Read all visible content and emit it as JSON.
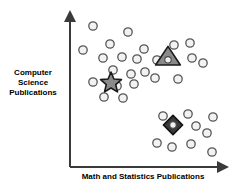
{
  "figure": {
    "background_color": "#ffffff",
    "axis_color": "#3a3a3a"
  },
  "axes": {
    "y_label": "Computer\nScience\nPublications",
    "x_label": "Math and Statistics Publications",
    "y_axis_name": "Computer Science Publications",
    "x_axis_name": "Math and Statistics Publications",
    "origin_x": 70,
    "origin_y": 167,
    "y_top": 14,
    "x_right": 226
  },
  "chart_data": {
    "type": "scatter",
    "title": "",
    "xlabel": "Math and Statistics Publications",
    "ylabel": "Computer Science Publications",
    "xlim": [
      0,
      100
    ],
    "ylim": [
      0,
      100
    ],
    "grid": false,
    "legend": "none",
    "axis_style": "arrow-axes",
    "tick_labels": {
      "x": [],
      "y": []
    },
    "series": [
      {
        "name": "Cluster 1 points",
        "marker": "circle",
        "marker_fill": "#f2f2f2",
        "marker_stroke": "#555555",
        "radius": 4.2,
        "points": [
          [
            93,
            26
          ],
          [
            128,
            32
          ],
          [
            110,
            44
          ],
          [
            83,
            50
          ],
          [
            144,
            49
          ],
          [
            103,
            58
          ],
          [
            122,
            57
          ],
          [
            113,
            70
          ],
          [
            137,
            59
          ],
          [
            131,
            74
          ],
          [
            145,
            72
          ],
          [
            93,
            82
          ],
          [
            117,
            86
          ],
          [
            134,
            84
          ],
          [
            104,
            97
          ],
          [
            123,
            98
          ],
          [
            178,
            79
          ]
        ]
      },
      {
        "name": "Cluster 2 points",
        "marker": "circle",
        "marker_fill": "#f2f2f2",
        "marker_stroke": "#555555",
        "radius": 4.2,
        "points": [
          [
            174,
            45
          ],
          [
            190,
            43
          ],
          [
            157,
            60
          ],
          [
            192,
            58
          ],
          [
            155,
            78
          ],
          [
            203,
            63
          ]
        ]
      },
      {
        "name": "Cluster 3 points",
        "marker": "circle",
        "marker_fill": "#f2f2f2",
        "marker_stroke": "#555555",
        "radius": 4.2,
        "points": [
          [
            163,
            116
          ],
          [
            188,
            114
          ],
          [
            213,
            117
          ],
          [
            196,
            126
          ],
          [
            157,
            143
          ],
          [
            172,
            147
          ],
          [
            191,
            144
          ],
          [
            207,
            133
          ],
          [
            212,
            152
          ]
        ]
      }
    ],
    "centroids": [
      {
        "name": "star-centroid",
        "marker": "star",
        "x": 111,
        "y": 83,
        "size": 11,
        "fill": "#8a8a8a",
        "stroke": "#1a1a1a"
      },
      {
        "name": "triangle-centroid",
        "marker": "triangle",
        "x": 168,
        "y": 57,
        "size": 13,
        "fill": "#8a8a8a",
        "stroke": "#1a1a1a",
        "inner_marker": "circle"
      },
      {
        "name": "diamond-centroid",
        "marker": "diamond",
        "x": 173,
        "y": 125,
        "size": 12,
        "fill": "#3a3a3a",
        "stroke": "#111111",
        "inner_marker": "circle"
      }
    ]
  }
}
